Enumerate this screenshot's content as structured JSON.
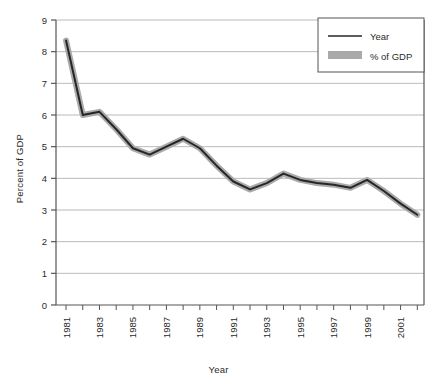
{
  "chart_data": {
    "type": "line",
    "title": "",
    "xlabel": "Year",
    "ylabel": "Percent of GDP",
    "xlim": [
      1980.4,
      2002.4
    ],
    "ylim": [
      0,
      9
    ],
    "grid": true,
    "legend_position": "top-right",
    "y_ticks": [
      "0",
      "1",
      "2",
      "3",
      "4",
      "5",
      "6",
      "7",
      "8",
      "9"
    ],
    "x_tick_labels": [
      "1981",
      "1983",
      "1985",
      "1987",
      "1989",
      "1991",
      "1993",
      "1995",
      "1997",
      "1999",
      "2001"
    ],
    "x": [
      1981,
      1982,
      1983,
      1984,
      1985,
      1986,
      1987,
      1988,
      1989,
      1990,
      1991,
      1992,
      1993,
      1994,
      1995,
      1996,
      1997,
      1998,
      1999,
      2000,
      2001,
      2002
    ],
    "series": [
      {
        "name": "% of GDP",
        "values": [
          8.35,
          6.0,
          6.1,
          5.55,
          4.95,
          4.75,
          5.0,
          5.25,
          4.95,
          4.4,
          3.9,
          3.65,
          3.85,
          4.15,
          3.95,
          3.85,
          3.8,
          3.7,
          3.95,
          3.6,
          3.2,
          2.85
        ]
      }
    ],
    "legend": [
      {
        "label": "Year",
        "marker": "line",
        "color": "#262626"
      },
      {
        "label": "% of GDP",
        "marker": "band",
        "color": "#aaaaaa"
      }
    ],
    "colors": {
      "line": "#262626",
      "shadow": "#aaaaaa",
      "grid": "#a8a8a8",
      "axis": "#555555",
      "background": "#ffffff"
    }
  }
}
